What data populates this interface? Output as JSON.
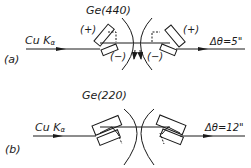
{
  "diagram": {
    "panel_a": {
      "label": "(a)",
      "crystal": "Ge(440)",
      "source": "Cu Kα",
      "source_main": "Cu K",
      "source_sub": "α",
      "left_crystal_upper_sign": "(+)",
      "left_crystal_lower_sign": "(−)",
      "right_crystal_upper_sign": "(+)",
      "right_crystal_lower_sign": "(−)",
      "output": "Δθ=5\""
    },
    "panel_b": {
      "label": "(b)",
      "crystal": "Ge(220)",
      "source": "Cu Kα",
      "source_main": "Cu K",
      "source_sub": "α",
      "output": "Δθ=12\""
    },
    "colors": {
      "ink": "#1a1a1a",
      "background": "#ffffff"
    }
  }
}
